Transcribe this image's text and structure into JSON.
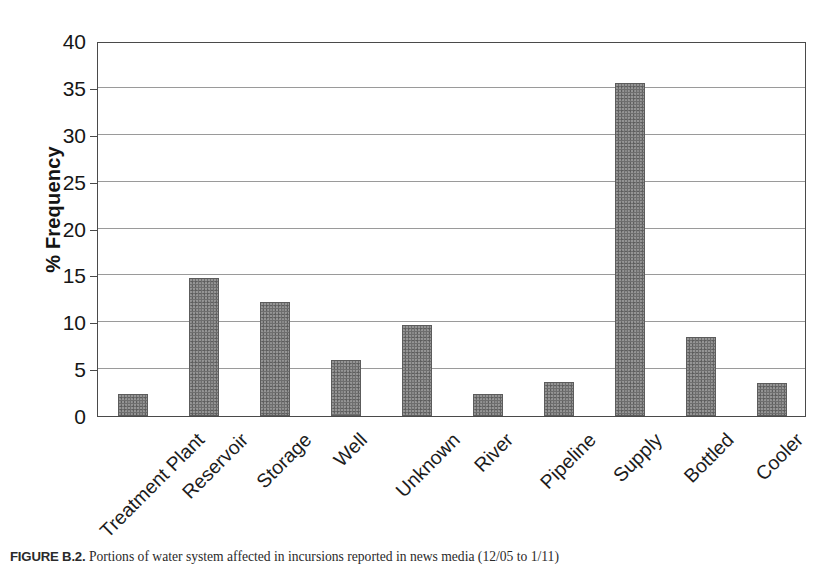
{
  "figure": {
    "caption_label": "FIGURE B.2.",
    "caption_text": "Portions of water system affected in incursions reported in news media (12/05 to 1/11)"
  },
  "chart_data": {
    "type": "bar",
    "title": "",
    "subtitle": "",
    "xlabel": "",
    "ylabel": "% Frequency",
    "categories": [
      "Treatment Plant",
      "Reservoir",
      "Storage",
      "Well",
      "Unknown",
      "River",
      "Pipeline",
      "Supply",
      "Bottled",
      "Cooler"
    ],
    "values": [
      2.3,
      14.7,
      12.2,
      6.0,
      9.7,
      2.3,
      3.6,
      35.5,
      8.4,
      3.5
    ],
    "ylim": [
      0,
      40
    ],
    "ytick_labels": [
      "0",
      "5",
      "10",
      "15",
      "20",
      "25",
      "30",
      "35",
      "40"
    ],
    "ytick_values": [
      0,
      5,
      10,
      15,
      20,
      25,
      30,
      35,
      40
    ],
    "grid": "horizontal",
    "legend": "none",
    "bar_color": "#6e6e6e",
    "axis_color": "#4a4a4a",
    "gridline_color": "#9a9a9a",
    "background_color": "#ffffff"
  }
}
